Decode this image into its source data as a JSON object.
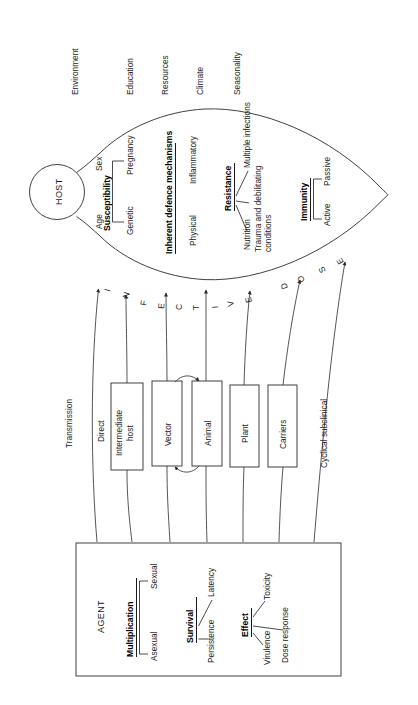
{
  "diagram": {
    "title_nodes": {
      "host": "HOST",
      "agent": "AGENT"
    },
    "environment_factors": [
      {
        "label": "Environment"
      },
      {
        "label": "Education"
      },
      {
        "label": "Resources"
      },
      {
        "label": "Climate"
      },
      {
        "label": "Seasonality"
      }
    ],
    "host_groups": [
      {
        "heading": "Susceptibility",
        "items": [
          "Age",
          "Sex",
          "Genetic",
          "Pregnancy"
        ]
      },
      {
        "heading": "Inherent defence mechanisms",
        "items": [
          "Physical",
          "Inflammatory"
        ]
      },
      {
        "heading": "Resistance",
        "items": [
          "Nutrition",
          "Multiple infections",
          "Trauma and debilitating",
          "conditions"
        ]
      },
      {
        "heading": "Immunity",
        "items": [
          "Active",
          "Passive"
        ]
      }
    ],
    "transmission": {
      "heading": "Transmission",
      "routes": [
        {
          "label": "Direct",
          "boxed": false
        },
        {
          "label": "Intermediate",
          "label2": "host",
          "boxed": true
        },
        {
          "label": "Vector",
          "boxed": true
        },
        {
          "label": "Animal",
          "boxed": true
        },
        {
          "label": "Plant",
          "boxed": true
        },
        {
          "label": "Carriers",
          "boxed": true
        },
        {
          "label": "Cyclical subclinical",
          "boxed": false
        }
      ]
    },
    "arc_label": {
      "text": "INFECTIVE DOSE",
      "letters": [
        "I",
        "N",
        "F",
        "E",
        "C",
        "T",
        "I",
        "V",
        "E",
        "D",
        "O",
        "S",
        "E"
      ]
    },
    "agent_groups": [
      {
        "heading": "Multiplication",
        "items": [
          "Asexual",
          "Sexual"
        ]
      },
      {
        "heading": "Survival",
        "items": [
          "Persistence",
          "Latency"
        ]
      },
      {
        "heading": "Effect",
        "items": [
          "Virulence",
          "Toxicity",
          "Dose response"
        ]
      }
    ],
    "colors": {
      "stroke": "#2b2b2b",
      "text": "#1a1a1a",
      "background": "#ffffff"
    }
  }
}
